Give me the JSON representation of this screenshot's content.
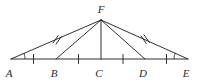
{
  "figure": {
    "type": "geometry-diagram",
    "stroke_color": "#1a1a1a",
    "label_color": "#2b2b2b",
    "background_color": "#ffffff"
  },
  "points": [
    {
      "id": "A",
      "label": "A",
      "x": 11,
      "y": 59,
      "label_x": 9,
      "label_y": 76
    },
    {
      "id": "B",
      "label": "B",
      "x": 56,
      "y": 59,
      "label_x": 53,
      "label_y": 76
    },
    {
      "id": "C",
      "label": "C",
      "x": 101,
      "y": 59,
      "label_x": 98,
      "label_y": 76
    },
    {
      "id": "D",
      "label": "D",
      "x": 145,
      "y": 59,
      "label_x": 142,
      "label_y": 76
    },
    {
      "id": "E",
      "label": "E",
      "x": 188,
      "y": 59,
      "label_x": 185,
      "label_y": 76
    },
    {
      "id": "F",
      "label": "F",
      "x": 101,
      "y": 20,
      "label_x": 97,
      "label_y": 12
    }
  ],
  "segments": [
    {
      "id": "AF",
      "from": "A",
      "to": "F",
      "ticks": 2
    },
    {
      "id": "FE",
      "from": "F",
      "to": "E",
      "ticks": 2
    },
    {
      "id": "FB",
      "from": "F",
      "to": "B",
      "ticks": 0
    },
    {
      "id": "FC",
      "from": "F",
      "to": "C",
      "ticks": 0
    },
    {
      "id": "FD",
      "from": "F",
      "to": "D",
      "ticks": 0
    },
    {
      "id": "AE",
      "from": "A",
      "to": "E",
      "ticks": 0
    }
  ],
  "base_tick_marks": [
    {
      "id": "tick-AB",
      "segment": "AB",
      "x": 33.5,
      "count": 1
    },
    {
      "id": "tick-BC",
      "segment": "BC",
      "x": 78.5,
      "count": 1
    },
    {
      "id": "tick-CD",
      "segment": "CD",
      "x": 123.0,
      "count": 1
    },
    {
      "id": "tick-DE",
      "segment": "DE",
      "x": 166.5,
      "count": 1
    }
  ],
  "angle_marks": [
    {
      "id": "angle-A",
      "vertex": "A",
      "radius": 13
    },
    {
      "id": "angle-E",
      "vertex": "E",
      "radius": 13
    }
  ],
  "leg_tick_marks": [
    {
      "id": "tick-AF",
      "segment": "AF",
      "count": 2
    },
    {
      "id": "tick-FE",
      "segment": "FE",
      "count": 2
    }
  ]
}
